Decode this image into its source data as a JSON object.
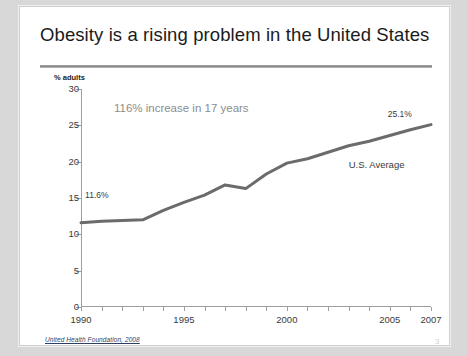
{
  "slide": {
    "title": "Obesity is a rising problem in the United States",
    "source": "United Health Foundation, 2008",
    "page_number": "3"
  },
  "chart_data": {
    "type": "line",
    "title": "Obesity is a rising problem in the United States",
    "xlabel": "",
    "ylabel": "% adults",
    "xlim": [
      1990,
      2007
    ],
    "ylim": [
      0,
      30
    ],
    "grid": false,
    "legend": "none",
    "ytick_labels": [
      "0",
      "5",
      "10",
      "15",
      "20",
      "25",
      "30"
    ],
    "ytick_values": [
      0,
      5,
      10,
      15,
      20,
      25,
      30
    ],
    "xtick_labels": [
      "1990",
      "1995",
      "2000",
      "2005",
      "2007"
    ],
    "xtick_values": [
      1990,
      1995,
      2000,
      2005,
      2007
    ],
    "series": [
      {
        "name": "U.S. Average",
        "color": "#6b6b6b",
        "x": [
          1990,
          1991,
          1992,
          1993,
          1994,
          1995,
          1996,
          1997,
          1998,
          1999,
          2000,
          2001,
          2002,
          2003,
          2004,
          2005,
          2006,
          2007
        ],
        "values": [
          11.6,
          11.8,
          11.9,
          12.0,
          13.3,
          14.4,
          15.4,
          16.8,
          16.3,
          18.3,
          19.8,
          20.4,
          21.3,
          22.2,
          22.8,
          23.6,
          24.4,
          25.1
        ]
      }
    ],
    "annotations": [
      {
        "name": "increase-callout",
        "text": "116% increase in 17 years"
      },
      {
        "name": "start-value",
        "text": "11.6%"
      },
      {
        "name": "end-value",
        "text": "25.1%"
      },
      {
        "name": "series-label",
        "text": "U.S. Average"
      }
    ]
  }
}
